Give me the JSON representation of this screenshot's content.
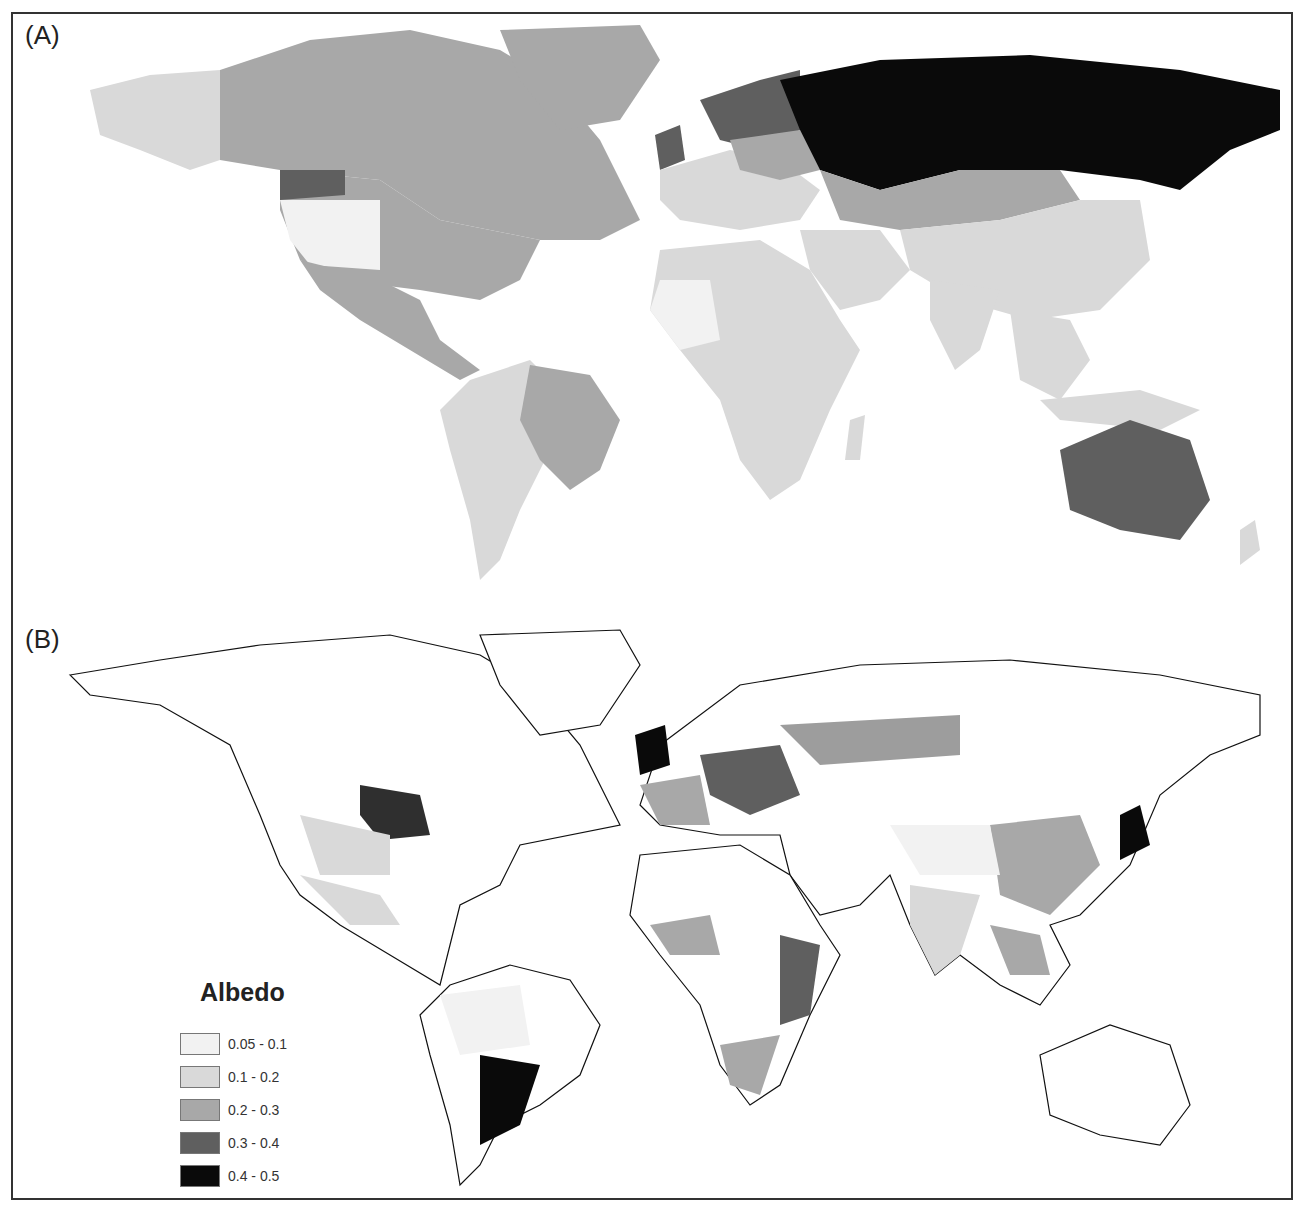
{
  "figure": {
    "panels": [
      {
        "label": "(A)",
        "description": "World map, albedo by country/region (choropleth)"
      },
      {
        "label": "(B)",
        "description": "World map, gridded albedo values with country boundaries"
      }
    ]
  },
  "legend": {
    "title": "Albedo",
    "items": [
      {
        "label": "0.05 - 0.1",
        "color": "#f2f2f2"
      },
      {
        "label": "0.1 - 0.2",
        "color": "#d9d9d9"
      },
      {
        "label": "0.2 - 0.3",
        "color": "#a8a8a8"
      },
      {
        "label": "0.3 - 0.4",
        "color": "#5f5f5f"
      },
      {
        "label": "0.4 - 0.5",
        "color": "#0a0a0a"
      }
    ]
  },
  "regions_panel_a": {
    "russia": "0.4 - 0.5",
    "scandinavia": "0.3 - 0.4",
    "australia": "0.3 - 0.4",
    "canada": "0.2 - 0.3",
    "brazil": "0.2 - 0.3",
    "greenland": "0.2 - 0.3",
    "usa_north": "0.2 - 0.3",
    "africa": "0.1 - 0.2",
    "asia_south": "0.1 - 0.2",
    "europe": "0.1 - 0.2"
  }
}
